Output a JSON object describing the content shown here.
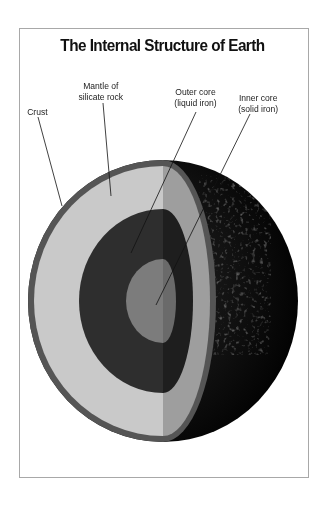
{
  "title": "The Internal Structure of Earth",
  "labels": {
    "crust": "Crust",
    "mantle_line1": "Mantle of",
    "mantle_line2": "silicate rock",
    "outer_core_line1": "Outer core",
    "outer_core_line2": "(liquid iron)",
    "inner_core_line1": "Inner core",
    "inner_core_line2": "(solid iron)"
  },
  "colors": {
    "crust": "#555555",
    "mantle": "#c9c9c9",
    "mantle_shaded": "#9e9e9e",
    "outer_core": "#2e2e2e",
    "outer_core_shaded": "#1e1e1e",
    "inner_core": "#7c7c7c",
    "inner_core_shaded": "#6a6a6a",
    "surface": "#0a0a0a"
  }
}
